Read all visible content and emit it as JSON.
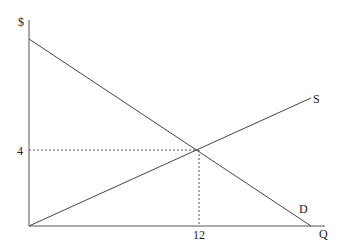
{
  "diagram": {
    "y_axis_label": "$",
    "x_axis_label": "Q",
    "supply_label": "S",
    "demand_label": "D",
    "equilibrium_price": "4",
    "equilibrium_quantity": "12"
  },
  "colors": {
    "line": "#444444",
    "text": "#222222",
    "background": "#ffffff"
  }
}
